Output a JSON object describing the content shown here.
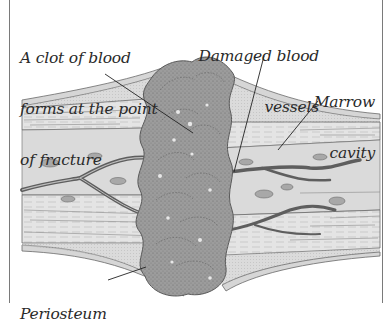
{
  "diagram": {
    "labels": [
      {
        "id": "clot",
        "lines": [
          "A clot of blood",
          "forms at the point",
          "of fracture"
        ]
      },
      {
        "id": "vessels",
        "lines": [
          "Damaged blood",
          "vessels"
        ]
      },
      {
        "id": "marrow",
        "lines": [
          "Marrow",
          "cavity"
        ]
      },
      {
        "id": "periosteum",
        "lines": [
          "Periosteum"
        ]
      }
    ],
    "colors": {
      "background": "#ffffff",
      "border": "#7a7a7a",
      "bone_fill": "#e6e6e6",
      "bone_lines": "#6a6a6a",
      "clot_fill": "#9a9a9a",
      "clot_dark": "#6e6e6e",
      "vessel": "#5e5e5e",
      "leader": "#222222",
      "text": "#2a2a2a"
    }
  }
}
